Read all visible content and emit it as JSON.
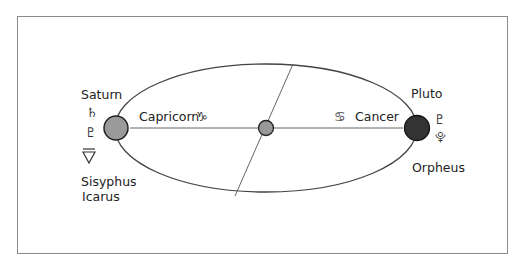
{
  "diagram": {
    "left_body": {
      "name": "Saturn",
      "sign": "Capricorn",
      "sign_symbol": "♑",
      "planet_symbol": "♄",
      "extra_symbols": [
        "♇",
        "▽"
      ],
      "figures": [
        "Sisyphus",
        "Icarus"
      ],
      "color": "#9a9a9a"
    },
    "right_body": {
      "name": "Pluto",
      "sign": "Cancer",
      "sign_symbol": "♋",
      "planet_symbol": "♇",
      "extra_symbols": [
        "⯓"
      ],
      "figures": [
        "Orpheus"
      ],
      "color": "#333333"
    },
    "center_body": {
      "color": "#9a9a9a"
    },
    "colors": {
      "line": "#444444",
      "frame": "#8a8a8a"
    }
  }
}
